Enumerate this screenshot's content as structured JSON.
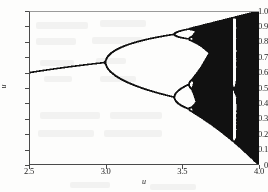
{
  "figure": {
    "background_color": "#fdfdfc",
    "ink_color": "#111111",
    "axis_color": "#4a4a4a"
  },
  "axes": {
    "ylabel": "u",
    "xlabel": "u",
    "x_ticks": [
      "2.5",
      "3.0",
      "3.5",
      "4.0"
    ],
    "x_tick_values": [
      2.5,
      3.0,
      3.5,
      4.0
    ],
    "y_ticks": [
      "0",
      "0.1",
      "0.2",
      "0.3",
      "0.4",
      "0.5",
      "0.6",
      "0.7",
      "0.8",
      "0.9",
      "1.0"
    ],
    "y_tick_values": [
      0,
      0.1,
      0.2,
      0.3,
      0.4,
      0.5,
      0.6,
      0.7,
      0.8,
      0.9,
      1.0
    ]
  },
  "chart_data": {
    "type": "scatter",
    "title": "",
    "xlabel": "u",
    "ylabel": "u",
    "xlim": [
      2.5,
      4.0
    ],
    "ylim": [
      0.0,
      1.0
    ],
    "grid": false,
    "legend": "none",
    "map": {
      "equation": "x_next = u * x * (1 - x)",
      "param_min": 2.5,
      "param_max": 4.0,
      "param_steps": 1400,
      "transient_iterations": 320,
      "plot_iterations": 700,
      "seed": 0.31
    },
    "features": [
      {
        "name": "fixed-point-branch",
        "u_range": [
          2.5,
          3.0
        ],
        "y_start": 0.6,
        "y_end": 0.667
      },
      {
        "name": "period-2-bifurcation",
        "u": 3.0,
        "y": 0.667
      },
      {
        "name": "period-4-bifurcation",
        "u": 3.449,
        "y_upper": 0.85,
        "y_lower": 0.44
      },
      {
        "name": "period-8-bifurcation",
        "u": 3.544
      },
      {
        "name": "chaos-onset",
        "u": 3.5699
      },
      {
        "name": "period-3-window",
        "u_range": [
          3.828,
          3.857
        ]
      },
      {
        "name": "upper-envelope-at-4",
        "u": 4.0,
        "y": 1.0
      },
      {
        "name": "lower-envelope-at-4",
        "u": 4.0,
        "y": 0.0
      }
    ],
    "series": [
      {
        "name": "attractor",
        "color": "#111111",
        "marker": "pixel",
        "point_size": 0.6
      }
    ]
  }
}
